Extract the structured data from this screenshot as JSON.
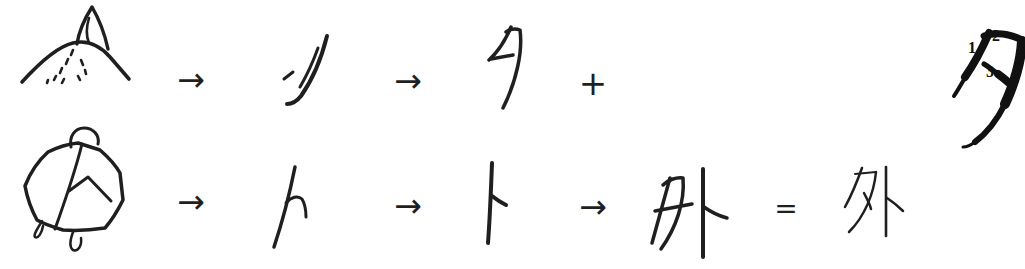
{
  "symbols": {
    "arrow": "→",
    "plus": "+",
    "equals": "="
  },
  "row1": {
    "pictograph_icon": "crescent-moon-rising-over-hill",
    "oracle_form_icon": "simplified-crescent-moon-glyph",
    "character": "夕"
  },
  "row2": {
    "pictograph_icon": "turtle-plastron-with-divination-crack",
    "oracle_form_icon": "divination-crack-glyph",
    "character": "卜",
    "combined_character": "外",
    "result_character": "外"
  },
  "stroke_order_diagram": {
    "character": "夕",
    "stroke_labels": [
      "1",
      "2",
      "3"
    ]
  },
  "colors": {
    "ink": "#1f1f1f",
    "background": "#ffffff"
  }
}
